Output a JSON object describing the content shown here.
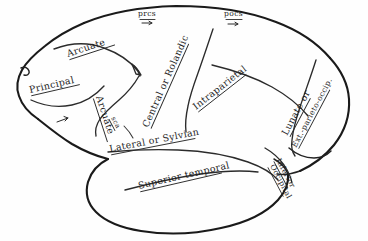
{
  "figure": {
    "kind": "anatomical-line-drawing",
    "ink_color": "#1a1a1a",
    "paper_color": "#fefefe"
  },
  "labels": {
    "prcs": "prcs",
    "pocs": "pocs",
    "sca": "sca",
    "arcuate_upper": "Arcuate",
    "arcuate_lower": "Arcuate",
    "principal": "Principal",
    "central_or_rolandic": "Central or Rolandic",
    "intraparietal": "Intraparietal",
    "lateral_or_sylvian": "Lateral or Sylvian",
    "superior_temporal": "Superior temporal",
    "lunate_or": "Lunate or",
    "ext_parieto_occip": "Ext.-parieto-occip.",
    "inferior": "Inferior",
    "occipital": "Occipital"
  }
}
